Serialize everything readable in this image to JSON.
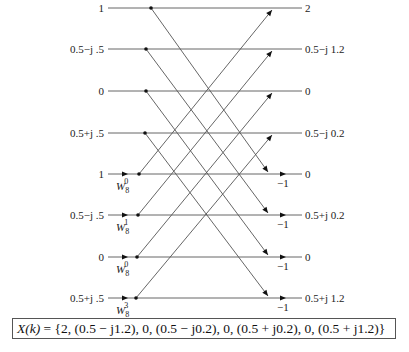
{
  "diagram": {
    "type": "radix-2 DIT/DIF butterfly stage (8-point FFT)",
    "inputs": [
      "1",
      "0.5−j .5",
      "0",
      "0.5+j .5",
      "1",
      "0.5−j .5",
      "0",
      "0.5+j .5"
    ],
    "outputs": [
      "2",
      "0.5−j 1.2",
      "0",
      "0.5−j 0.2",
      "0",
      "0.5+j 0.2",
      "0",
      "0.5+j 1.2"
    ],
    "twiddles": [
      {
        "row": 4,
        "base": "W",
        "sub": "8",
        "sup": "0"
      },
      {
        "row": 5,
        "base": "W",
        "sub": "8",
        "sup": "1"
      },
      {
        "row": 6,
        "base": "W",
        "sub": "8",
        "sup": "0"
      },
      {
        "row": 7,
        "base": "W",
        "sub": "8",
        "sup": "3"
      }
    ],
    "output_multipliers": [
      {
        "row": 4,
        "value": "−1"
      },
      {
        "row": 5,
        "value": "−1"
      },
      {
        "row": 6,
        "value": "−1"
      },
      {
        "row": 7,
        "value": "−1"
      }
    ],
    "row_y": [
      8,
      49,
      91,
      133,
      174,
      215,
      257,
      298
    ],
    "line_color": "#555555"
  },
  "result": {
    "lhs": "X(k)",
    "text": " = {2, (0.5 − j1.2), 0, (0.5 − j0.2), 0, (0.5 + j0.2), 0, (0.5 + j1.2)}"
  }
}
